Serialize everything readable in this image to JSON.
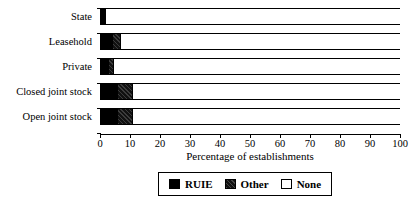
{
  "chart_data": {
    "type": "bar",
    "orientation": "horizontal",
    "stacked": true,
    "title": "",
    "xlabel": "Percentage of establishments",
    "ylabel": "",
    "xlim": [
      0,
      100
    ],
    "xticks": [
      0,
      10,
      20,
      30,
      40,
      50,
      60,
      70,
      80,
      90,
      100
    ],
    "xtick_labels": [
      "0",
      "10",
      "20",
      "30",
      "40",
      "50",
      "60",
      "70",
      "80",
      "90",
      "100"
    ],
    "grid": false,
    "legend_position": "bottom",
    "categories": [
      "State",
      "Leasehold",
      "Private",
      "Closed joint stock",
      "Open joint stock"
    ],
    "series": [
      {
        "name": "RUIE",
        "color": "#000000",
        "values": [
          1.8,
          4.0,
          2.5,
          5.5,
          5.5
        ]
      },
      {
        "name": "Other",
        "color": "#111111",
        "values": [
          0.0,
          2.5,
          1.8,
          5.0,
          5.0
        ]
      },
      {
        "name": "None",
        "color": "#ffffff",
        "values": [
          98.2,
          93.5,
          95.7,
          89.5,
          89.5
        ]
      }
    ]
  },
  "axis": {
    "x_title": "Percentage of establishments",
    "tick_labels": [
      "0",
      "10",
      "20",
      "30",
      "40",
      "50",
      "60",
      "70",
      "80",
      "90",
      "100"
    ]
  },
  "categories": [
    {
      "label": "State"
    },
    {
      "label": "Leasehold"
    },
    {
      "label": "Private"
    },
    {
      "label": "Closed joint stock"
    },
    {
      "label": "Open joint stock"
    }
  ],
  "legend": {
    "items": [
      {
        "label": "RUIE",
        "swatch": "solid-black"
      },
      {
        "label": "Other",
        "swatch": "dark-hatched"
      },
      {
        "label": "None",
        "swatch": "white-outline"
      }
    ]
  }
}
